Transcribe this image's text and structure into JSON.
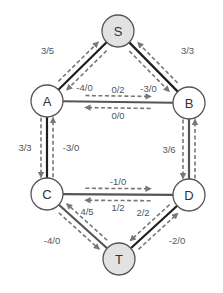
{
  "diagram": {
    "type": "flow-network-residual-graph",
    "colors": {
      "source_sink_fill": "#e2e2e2",
      "inner_node_fill": "#ffffff",
      "node_stroke": "#555555",
      "edge_dark": "#1e1e1e",
      "edge_medium": "#555555",
      "dashed_arrow": "#777777",
      "label_text": "#555555"
    },
    "nodes": [
      {
        "id": "S",
        "label": "S",
        "kind": "source"
      },
      {
        "id": "A",
        "label": "A",
        "kind": "inner"
      },
      {
        "id": "B",
        "label": "B",
        "kind": "inner"
      },
      {
        "id": "C",
        "label": "C",
        "kind": "inner"
      },
      {
        "id": "D",
        "label": "D",
        "kind": "inner"
      },
      {
        "id": "T",
        "label": "T",
        "kind": "sink"
      }
    ],
    "edges": [
      {
        "id": "S-A",
        "from": "S",
        "to": "A",
        "forward_label": "3/5",
        "reverse_label": "-4/0",
        "style": "dark"
      },
      {
        "id": "S-B",
        "from": "S",
        "to": "B",
        "forward_label": "3/3",
        "reverse_label": "-3/0",
        "style": "dark"
      },
      {
        "id": "A-B",
        "from": "A",
        "to": "B",
        "forward_label": "0/2",
        "reverse_label": "0/0",
        "style": "medium"
      },
      {
        "id": "A-C",
        "from": "A",
        "to": "C",
        "forward_label": "3/3",
        "reverse_label": "-3/0",
        "style": "dark"
      },
      {
        "id": "B-D",
        "from": "B",
        "to": "D",
        "forward_label": "3/6",
        "reverse_label": "",
        "style": "medium"
      },
      {
        "id": "C-D",
        "from": "C",
        "to": "D",
        "forward_label": "-1/0",
        "reverse_label": "1/2",
        "style": "medium"
      },
      {
        "id": "C-T",
        "from": "C",
        "to": "T",
        "forward_label": "4/5",
        "reverse_label": "-4/0",
        "style": "medium"
      },
      {
        "id": "D-T",
        "from": "D",
        "to": "T",
        "forward_label": "2/2",
        "reverse_label": "-2/0",
        "style": "dark"
      }
    ]
  }
}
